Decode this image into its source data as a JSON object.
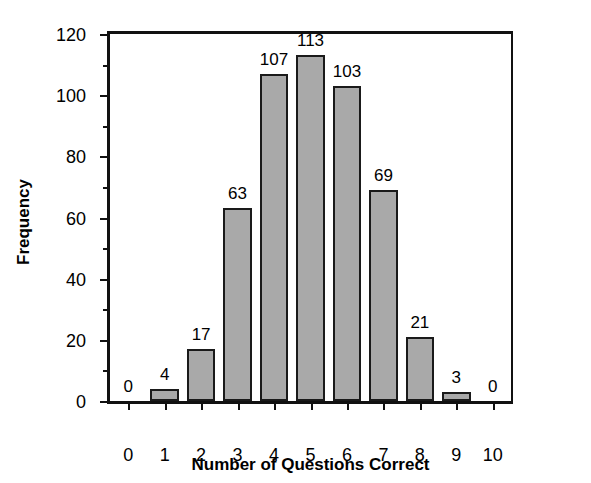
{
  "chart_data": {
    "type": "bar",
    "title": "",
    "xlabel": "Number of Questions Correct",
    "ylabel": "Frequency",
    "categories": [
      "0",
      "1",
      "2",
      "3",
      "4",
      "5",
      "6",
      "7",
      "8",
      "9",
      "10"
    ],
    "values": [
      0,
      4,
      17,
      63,
      107,
      113,
      103,
      69,
      21,
      3,
      0
    ],
    "bar_labels": [
      "0",
      "4",
      "17",
      "63",
      "107",
      "113",
      "103",
      "69",
      "21",
      "3",
      "0"
    ],
    "ylim": [
      0,
      120
    ],
    "xlim": [
      -0.5,
      10.5
    ],
    "y_major_ticks": [
      0,
      20,
      40,
      60,
      80,
      100,
      120
    ],
    "y_major_tick_labels": [
      "0",
      "20",
      "40",
      "60",
      "80",
      "100",
      "120"
    ],
    "y_minor_ticks": [
      10,
      30,
      50,
      70,
      90,
      110
    ],
    "x_ticks": [
      "0",
      "1",
      "2",
      "3",
      "4",
      "5",
      "6",
      "7",
      "8",
      "9",
      "10"
    ],
    "grid": false,
    "legend": false,
    "legend_position": "none",
    "bar_fill_color": "#a9a9a9",
    "bar_edge_color": "#1a1a1a",
    "axis_color": "#111111",
    "background_color": "#ffffff"
  }
}
